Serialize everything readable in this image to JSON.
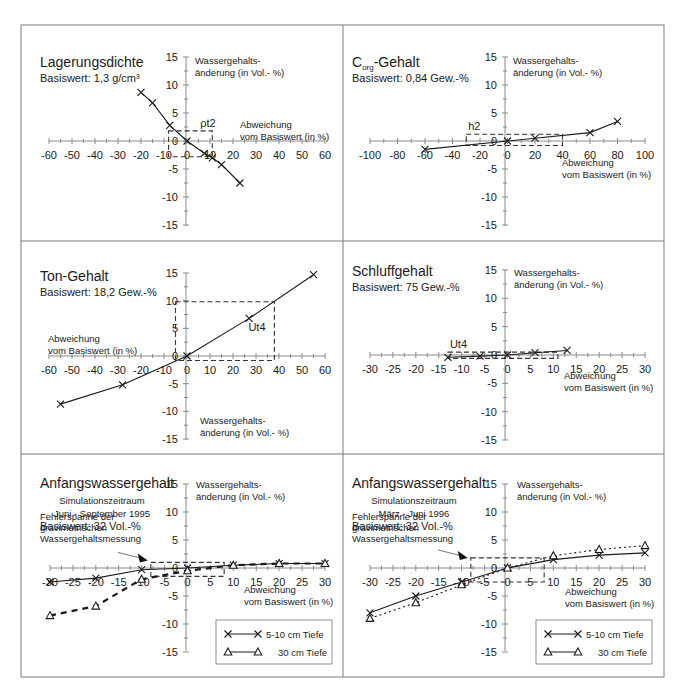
{
  "figure": {
    "frame_color": "#7a7a7a",
    "line_color": "#1a1a1a",
    "axis_color": "#8a8a8a"
  },
  "panels": [
    {
      "title": "Lagerungsdichte",
      "subtitle": "Basiswert: 1,3 g/cm³",
      "ylabel_1": "Wassergehalts-",
      "ylabel_2": "änderung (in Vol.- %)",
      "xlabel_1": "Abweichung",
      "xlabel_2": "vom Basiswert (in %)",
      "box_label": "ρt2"
    },
    {
      "title": "C",
      "title_sub": "org",
      "title_rest": "-Gehalt",
      "subtitle": "Basiswert: 0,84 Gew.-%",
      "ylabel_1": "Wassergehalts-",
      "ylabel_2": "änderung (in Vol.- %)",
      "xlabel_1": "Abweichung",
      "xlabel_2": "vom Basiswert (in %)",
      "box_label": "h2"
    },
    {
      "title": "Ton-Gehalt",
      "subtitle": "Basiswert: 18,2 Gew.-%",
      "ylabel_1": "Wassergehalts-",
      "ylabel_2": "änderung (in Vol.- %)",
      "xlabel_1": "Abweichung",
      "xlabel_2": "vom Basiswert (in %)",
      "box_label": "Ut4"
    },
    {
      "title": "Schluffgehalt",
      "subtitle": "Basiswert: 75 Gew.-%",
      "ylabel_1": "Wassergehalts-",
      "ylabel_2": "änderung (in Vol.- %)",
      "xlabel_1": "Abweichung",
      "xlabel_2": "vom Basiswert (in %)",
      "box_label": "Ut4"
    },
    {
      "title": "Anfangswassergehalt",
      "sim_1": "Simulationszeitraum",
      "sim_2": "Juni - September 1995",
      "subtitle": "Basiswert: 32 Vol.-%",
      "ylabel_1": "Wassergehalts-",
      "ylabel_2": "änderung (in Vol.- %)",
      "xlabel_1": "Abweichung",
      "xlabel_2": "vom Basiswert (in %)",
      "err_1": "Fehlerspanne der",
      "err_2": "gravimetrischen",
      "err_3": "Wassergehaltsmessung",
      "legend_1": "5-10 cm Tiefe",
      "legend_2": "30 cm Tiefe"
    },
    {
      "title": "Anfangswassergehalt",
      "sim_1": "Simulationszeitraum",
      "sim_2": "März - Juni 1996",
      "subtitle": "Basiswert: 32 Vol.-%",
      "ylabel_1": "Wassergehalts-",
      "ylabel_2": "änderung (in Vol.- %)",
      "xlabel_1": "Abweichung",
      "xlabel_2": "vom Basiswert (in %)",
      "err_1": "Fehlerspanne der",
      "err_2": "gravimetrischen",
      "err_3": "Wassergehaltsmessung",
      "legend_1": "5-10 cm Tiefe",
      "legend_2": "30 cm Tiefe"
    }
  ],
  "chart_data": [
    {
      "type": "line",
      "title": "Lagerungsdichte",
      "subtitle": "Basiswert: 1,3 g/cm³",
      "xlabel": "Abweichung vom Basiswert (in %)",
      "ylabel": "Wassergehaltsänderung (in Vol.- %)",
      "xlim": [
        -60,
        60
      ],
      "ylim": [
        -15,
        15
      ],
      "xticks": [
        -60,
        -50,
        -40,
        -30,
        -20,
        -10,
        0,
        10,
        20,
        30,
        40,
        50,
        60
      ],
      "yticks": [
        15,
        10,
        5,
        0,
        -5,
        -10,
        -15
      ],
      "series": [
        {
          "name": "Wassergehaltsänderung",
          "marker": "x",
          "style": "solid",
          "x": [
            -20,
            -15,
            -7.5,
            0,
            7.5,
            11,
            15,
            23
          ],
          "y": [
            8.7,
            6.8,
            2.8,
            0,
            -2.2,
            -3,
            -4.2,
            -7.5
          ]
        }
      ],
      "annotation_box": {
        "label": "ρt2",
        "x": [
          -8,
          11
        ],
        "y": [
          -2.8,
          1.8
        ]
      }
    },
    {
      "type": "line",
      "title": "Corg-Gehalt",
      "subtitle": "Basiswert: 0,84 Gew.-%",
      "xlabel": "Abweichung vom Basiswert (in %)",
      "ylabel": "Wassergehaltsänderung (in Vol.- %)",
      "xlim": [
        -100,
        100
      ],
      "ylim": [
        -15,
        15
      ],
      "xticks": [
        -100,
        -80,
        -60,
        -40,
        -20,
        0,
        20,
        40,
        60,
        80,
        100
      ],
      "yticks": [
        15,
        10,
        5,
        0,
        -5,
        -10,
        -15
      ],
      "series": [
        {
          "name": "Wassergehaltsänderung",
          "marker": "x",
          "style": "solid",
          "x": [
            -60,
            0,
            20,
            60,
            80
          ],
          "y": [
            -1.5,
            0,
            0.5,
            1.5,
            3.5
          ]
        }
      ],
      "annotation_box": {
        "label": "h2",
        "x": [
          -30,
          40
        ],
        "y": [
          -0.8,
          1.2
        ]
      }
    },
    {
      "type": "line",
      "title": "Ton-Gehalt",
      "subtitle": "Basiswert: 18,2 Gew.-%",
      "xlabel": "Abweichung vom Basiswert (in %)",
      "ylabel": "Wassergehaltsänderung (in Vol.- %)",
      "xlim": [
        -60,
        60
      ],
      "ylim": [
        -15,
        15
      ],
      "xticks": [
        -60,
        -50,
        -40,
        -30,
        -20,
        -10,
        0,
        10,
        20,
        30,
        40,
        50,
        60
      ],
      "yticks": [
        15,
        10,
        5,
        0,
        -5,
        -10,
        -15
      ],
      "series": [
        {
          "name": "Wassergehaltsänderung",
          "marker": "x",
          "style": "solid",
          "x": [
            -55,
            -28,
            0,
            27,
            55
          ],
          "y": [
            -8.7,
            -5.2,
            0,
            6.8,
            14.7
          ]
        }
      ],
      "annotation_box": {
        "label": "Ut4",
        "x": [
          -5,
          38
        ],
        "y": [
          -0.8,
          9.8
        ]
      }
    },
    {
      "type": "line",
      "title": "Schluffgehalt",
      "subtitle": "Basiswert: 75 Gew.-%",
      "xlabel": "Abweichung vom Basiswert (in %)",
      "ylabel": "Wassergehaltsänderung (in Vol.- %)",
      "xlim": [
        -30,
        30
      ],
      "ylim": [
        -15,
        15
      ],
      "xticks": [
        -30,
        -25,
        -20,
        -15,
        -10,
        -5,
        0,
        5,
        10,
        15,
        20,
        25,
        30
      ],
      "yticks": [
        15,
        10,
        5,
        0,
        -5,
        -10,
        -15
      ],
      "series": [
        {
          "name": "Wassergehaltsänderung",
          "marker": "x",
          "style": "solid",
          "x": [
            -13,
            -6,
            0,
            6,
            13
          ],
          "y": [
            -0.4,
            -0.2,
            0,
            0.4,
            0.8
          ]
        }
      ],
      "annotation_box": {
        "label": "Ut4",
        "x": [
          -13,
          11
        ],
        "y": [
          -0.6,
          0.5
        ]
      }
    },
    {
      "type": "line",
      "title": "Anfangswassergehalt",
      "subtitle": "Simulationszeitraum Juni - September 1995, Basiswert: 32 Vol.-%",
      "xlabel": "Abweichung vom Basiswert (in %)",
      "ylabel": "Wassergehaltsänderung (in Vol.- %)",
      "xlim": [
        -30,
        30
      ],
      "ylim": [
        -15,
        15
      ],
      "xticks": [
        -30,
        -25,
        -20,
        -15,
        -10,
        -5,
        0,
        5,
        10,
        15,
        20,
        25,
        30
      ],
      "yticks": [
        15,
        10,
        5,
        0,
        -5,
        -10,
        -15
      ],
      "legend_position": "lower right",
      "series": [
        {
          "name": "5-10 cm Tiefe",
          "marker": "x",
          "style": "solid",
          "x": [
            -30,
            -20,
            -10,
            0,
            10,
            20,
            30
          ],
          "y": [
            -2.5,
            -1.8,
            -0.3,
            0,
            0.5,
            0.8,
            0.8
          ]
        },
        {
          "name": "30 cm Tiefe",
          "marker": "triangle",
          "style": "dashed",
          "x": [
            -30,
            -20,
            -10,
            0,
            10,
            20,
            30
          ],
          "y": [
            -8.5,
            -6.8,
            -2,
            -0.5,
            0.5,
            0.8,
            0.8
          ]
        }
      ],
      "annotation_box": {
        "label": "Fehlerspanne der gravimetrischen Wassergehaltsmessung",
        "x": [
          -8,
          8
        ],
        "y": [
          -1.5,
          1
        ]
      }
    },
    {
      "type": "line",
      "title": "Anfangswassergehalt",
      "subtitle": "Simulationszeitraum März - Juni 1996, Basiswert: 32 Vol.-%",
      "xlabel": "Abweichung vom Basiswert (in %)",
      "ylabel": "Wassergehaltsänderung (in Vol.- %)",
      "xlim": [
        -30,
        30
      ],
      "ylim": [
        -15,
        15
      ],
      "xticks": [
        -30,
        -25,
        -20,
        -15,
        -10,
        -5,
        0,
        5,
        10,
        15,
        20,
        25,
        30
      ],
      "yticks": [
        15,
        10,
        5,
        0,
        -5,
        -10,
        -15
      ],
      "legend_position": "lower right",
      "series": [
        {
          "name": "5-10 cm Tiefe",
          "marker": "x",
          "style": "solid",
          "x": [
            -30,
            -20,
            -10,
            0,
            10,
            20,
            30
          ],
          "y": [
            -8,
            -5,
            -2.5,
            0,
            1.5,
            2.3,
            2.7
          ]
        },
        {
          "name": "30 cm Tiefe",
          "marker": "triangle",
          "style": "dotted",
          "x": [
            -30,
            -20,
            -10,
            0,
            10,
            20,
            30
          ],
          "y": [
            -9,
            -6.2,
            -3,
            0,
            2.2,
            3.3,
            4
          ]
        }
      ],
      "annotation_box": {
        "label": "Fehlerspanne der gravimetrischen Wassergehaltsmessung",
        "x": [
          -8,
          8
        ],
        "y": [
          -2.5,
          1.8
        ]
      }
    }
  ]
}
